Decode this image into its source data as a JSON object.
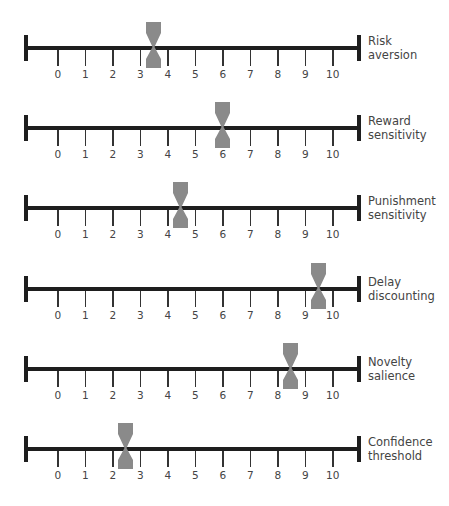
{
  "chart_data": {
    "type": "scatter",
    "title": "",
    "scale": {
      "min": 0,
      "max": 10,
      "ticks": [
        "0",
        "1",
        "2",
        "3",
        "4",
        "5",
        "6",
        "7",
        "8",
        "9",
        "10"
      ]
    },
    "marker_color": "#8a8a8a",
    "axis_color": "#1e1e1e",
    "rows": [
      {
        "label_line1": "Risk",
        "label_line2": "aversion",
        "value": 3.5
      },
      {
        "label_line1": "Reward",
        "label_line2": "sensitivity",
        "value": 6
      },
      {
        "label_line1": "Punishment",
        "label_line2": "sensitivity",
        "value": 4.5
      },
      {
        "label_line1": "Delay",
        "label_line2": "discounting",
        "value": 9.5
      },
      {
        "label_line1": "Novelty",
        "label_line2": "salience",
        "value": 8.5
      },
      {
        "label_line1": "Confidence",
        "label_line2": "threshold",
        "value": 2.5
      }
    ]
  }
}
